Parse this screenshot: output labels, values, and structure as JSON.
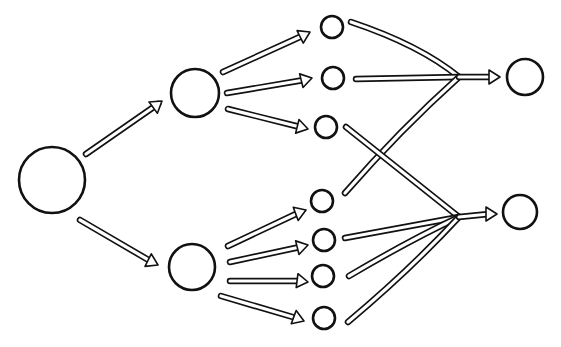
{
  "diagram": {
    "type": "network",
    "style": "hand-drawn",
    "colors": {
      "stroke": "#111111",
      "fill": "#ffffff",
      "background": "#ffffff"
    },
    "nodes": [
      {
        "id": "root",
        "cx": 52,
        "cy": 180,
        "r": 33
      },
      {
        "id": "mid_top",
        "cx": 195,
        "cy": 93,
        "r": 24
      },
      {
        "id": "mid_bottom",
        "cx": 192,
        "cy": 267,
        "r": 23
      },
      {
        "id": "leaf_t1",
        "cx": 332,
        "cy": 27,
        "r": 11
      },
      {
        "id": "leaf_t2",
        "cx": 333,
        "cy": 78,
        "r": 11
      },
      {
        "id": "leaf_t3",
        "cx": 326,
        "cy": 127,
        "r": 11
      },
      {
        "id": "leaf_b1",
        "cx": 322,
        "cy": 201,
        "r": 11
      },
      {
        "id": "leaf_b2",
        "cx": 324,
        "cy": 240,
        "r": 11
      },
      {
        "id": "leaf_b3",
        "cx": 323,
        "cy": 276,
        "r": 11
      },
      {
        "id": "leaf_b4",
        "cx": 324,
        "cy": 318,
        "r": 11
      },
      {
        "id": "out_top",
        "cx": 525,
        "cy": 77,
        "r": 18
      },
      {
        "id": "out_bottom",
        "cx": 520,
        "cy": 212,
        "r": 17
      }
    ],
    "arrows": [
      {
        "from": "root",
        "to": "mid_top",
        "path": "M86 154 L158 104",
        "head": [
          162,
          101
        ]
      },
      {
        "from": "root",
        "to": "mid_bottom",
        "path": "M80 220 L152 262",
        "head": [
          158,
          265
        ]
      },
      {
        "from": "mid_top",
        "to": "leaf_t1",
        "path": "M223 72 L302 36",
        "head": [
          310,
          32
        ]
      },
      {
        "from": "mid_top",
        "to": "leaf_t2",
        "path": "M227 93 L304 80",
        "head": [
          312,
          78
        ]
      },
      {
        "from": "mid_top",
        "to": "leaf_t3",
        "path": "M228 109 L300 127",
        "head": [
          308,
          129
        ]
      },
      {
        "from": "mid_bottom",
        "to": "leaf_b1",
        "path": "M228 246 L298 213",
        "head": [
          306,
          210
        ]
      },
      {
        "from": "mid_bottom",
        "to": "leaf_b2",
        "path": "M230 262 L300 247",
        "head": [
          308,
          245
        ]
      },
      {
        "from": "mid_bottom",
        "to": "leaf_b3",
        "path": "M230 281 L300 281",
        "head": [
          308,
          282
        ]
      },
      {
        "from": "mid_bottom",
        "to": "leaf_b4",
        "path": "M221 296 L296 318",
        "head": [
          304,
          321
        ]
      }
    ],
    "merges": [
      {
        "to": "out_top",
        "junction": [
          459,
          77
        ],
        "inputs": [
          {
            "from": "leaf_t1",
            "path": "M351 22 Q420 45 459 77"
          },
          {
            "from": "leaf_t2",
            "path": "M356 79 L459 77"
          },
          {
            "from": "leaf_b1",
            "path": "M345 193 Q400 130 459 77"
          }
        ],
        "output_path": "M459 77 L492 77",
        "head": [
          500,
          77
        ]
      },
      {
        "to": "out_bottom",
        "junction": [
          459,
          217
        ],
        "inputs": [
          {
            "from": "leaf_t3",
            "path": "M346 127 Q400 170 459 217"
          },
          {
            "from": "leaf_b2",
            "path": "M345 238 Q410 226 459 217"
          },
          {
            "from": "leaf_b3",
            "path": "M349 276 Q410 240 459 217"
          },
          {
            "from": "leaf_b4",
            "path": "M348 322 Q410 270 459 217"
          }
        ],
        "output_path": "M459 217 L489 214",
        "head": [
          497,
          214
        ]
      }
    ]
  }
}
